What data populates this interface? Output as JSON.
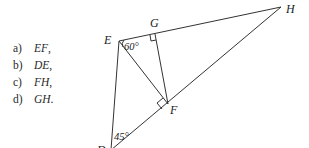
{
  "questions": [
    {
      "label": "a)",
      "segment": "EF",
      "punct": ","
    },
    {
      "label": "b)",
      "segment": "DE",
      "punct": ","
    },
    {
      "label": "c)",
      "segment": "FH",
      "punct": ","
    },
    {
      "label": "d)",
      "segment": "GH",
      "punct": "."
    }
  ],
  "figure": {
    "points": {
      "E": {
        "label": "E"
      },
      "G": {
        "label": "G"
      },
      "H": {
        "label": "H"
      },
      "F": {
        "label": "F"
      },
      "D": {
        "label": "D"
      }
    },
    "angles": {
      "E": "60°",
      "D": "45°"
    },
    "right_angles": [
      "G",
      "F"
    ],
    "line_color": "#333333"
  }
}
